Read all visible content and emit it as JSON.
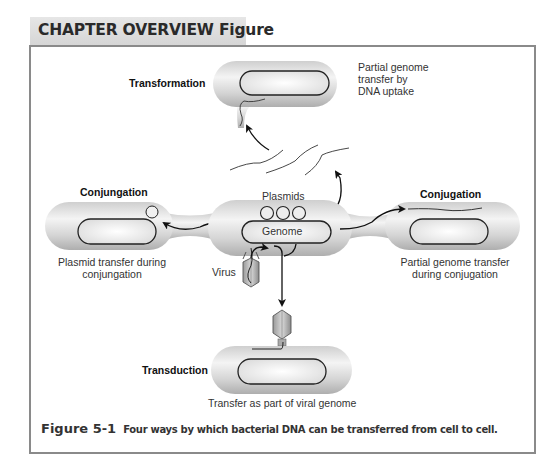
{
  "header": {
    "title": "CHAPTER OVERVIEW Figure"
  },
  "diagram": {
    "transformation": {
      "label": "Transformation",
      "description_lines": [
        "Partial genome",
        "transfer by",
        "DNA uptake"
      ]
    },
    "conjugation_left": {
      "label": "Conjungation",
      "description_lines": [
        "Plasmid transfer during",
        "conjungation"
      ]
    },
    "donor_cell": {
      "plasmids_label": "Plasmids",
      "genome_label": "Genome",
      "virus_label": "Virus"
    },
    "conjugation_right": {
      "label": "Conjugation",
      "description_lines": [
        "Partial genome transfer",
        "during conjugation"
      ]
    },
    "transduction": {
      "label": "Transduction",
      "description": "Transfer as part of viral genome"
    },
    "colors": {
      "cell_fill_dark": "#b9b9b9",
      "cell_fill_light": "#f2f2f2",
      "outline": "#222222",
      "frame_border": "#8a8a8a",
      "header_bg": "#dddddd"
    }
  },
  "caption": {
    "figure_number": "Figure 5-1",
    "text": "Four ways by which bacterial DNA can be transferred from cell to cell."
  }
}
